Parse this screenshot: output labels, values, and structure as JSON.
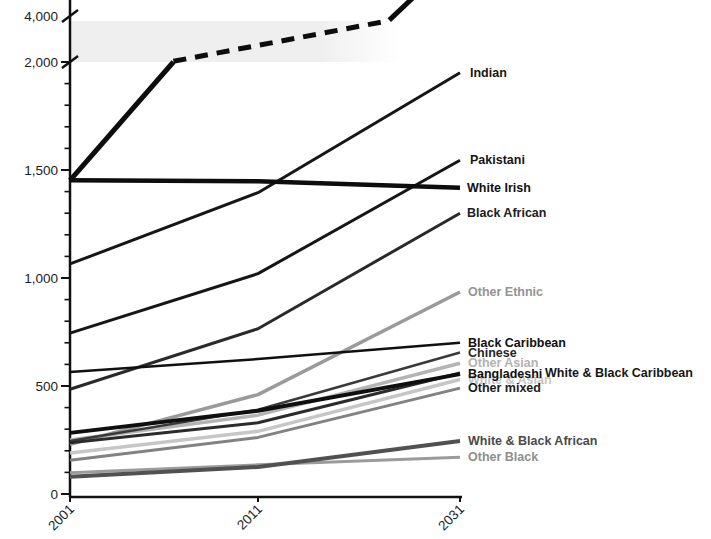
{
  "chart_data": {
    "type": "line",
    "title": "",
    "unit": "thousands",
    "x": [
      2001,
      2011,
      2031
    ],
    "x_tick_labels": [
      "2001",
      "2011",
      "2031"
    ],
    "y_ticks": [
      {
        "value": 0,
        "label": "0"
      },
      {
        "value": 500,
        "label": "500"
      },
      {
        "value": 1000,
        "label": "1,000"
      },
      {
        "value": 1500,
        "label": "1,500"
      },
      {
        "value": 2000,
        "label": "2,000"
      },
      {
        "value": 4000,
        "label": "4,000"
      }
    ],
    "y_minor_tick_step": 100,
    "axis_break": {
      "between": [
        2000,
        4000
      ],
      "band_color": "#efefef"
    },
    "grid": false,
    "legend_position": "right-edge-labels",
    "series": [
      {
        "id": "white-asian",
        "label": "White & Asian",
        "color": "#c6c6c6",
        "label_color": "#c4c4c4",
        "width": 3.5,
        "values": [
          190,
          290,
          530
        ]
      },
      {
        "id": "other-asian",
        "label": "Other Asian",
        "color": "#b4b4b4",
        "label_color": "#b2b2b2",
        "width": 3.5,
        "values": [
          250,
          365,
          605
        ]
      },
      {
        "id": "other-black",
        "label": "Other Black",
        "color": "#9b9b9b",
        "label_color": "#8e8e8e",
        "width": 3,
        "values": [
          98,
          135,
          170
        ]
      },
      {
        "id": "other-ethnic",
        "label": "Other Ethnic",
        "color": "#9a9a9a",
        "label_color": "#949494",
        "width": 3.5,
        "values": [
          230,
          460,
          935
        ]
      },
      {
        "id": "other-mixed",
        "label": "Other mixed",
        "color": "#828282",
        "label_color": "#1a1a1a",
        "width": 3,
        "values": [
          156,
          262,
          490
        ]
      },
      {
        "id": "white-black-african",
        "label": "White & Black African",
        "color": "#515151",
        "label_color": "#4a4a4a",
        "width": 4,
        "values": [
          80,
          125,
          245
        ]
      },
      {
        "id": "chinese",
        "label": "Chinese",
        "color": "#3a3a3a",
        "label_color": "#262626",
        "width": 2.5,
        "values": [
          245,
          390,
          655
        ]
      },
      {
        "id": "white-black-caribbean",
        "label": "White & Black Caribbean",
        "color": "#2b2b2b",
        "label_color": "#161616",
        "width": 3,
        "values": [
          237,
          330,
          560
        ],
        "label_x": 545
      },
      {
        "id": "black-african",
        "label": "Black African",
        "color": "#2a2a2a",
        "label_color": "#202020",
        "width": 3,
        "values": [
          485,
          765,
          1300
        ],
        "label_x": 467
      },
      {
        "id": "black-caribbean",
        "label": "Black Caribbean",
        "color": "#101010",
        "label_color": "#101010",
        "width": 2.5,
        "values": [
          565,
          625,
          700
        ]
      },
      {
        "id": "bangladeshi",
        "label": "Bangladeshi",
        "color": "#0f0f0f",
        "label_color": "#101010",
        "width": 4,
        "values": [
          283,
          385,
          555
        ]
      },
      {
        "id": "pakistani",
        "label": "Pakistani",
        "color": "#161616",
        "label_color": "#161616",
        "width": 3,
        "values": [
          745,
          1020,
          1545
        ],
        "label_x": 470
      },
      {
        "id": "indian",
        "label": "Indian",
        "color": "#161616",
        "label_color": "#161616",
        "width": 3,
        "values": [
          1065,
          1395,
          1950
        ],
        "label_x": 470
      },
      {
        "id": "white-irish",
        "label": "White Irish",
        "color": "#0d0d0d",
        "label_color": "#101010",
        "width": 4.5,
        "values": [
          1452,
          1448,
          1418
        ],
        "label_x": 467
      }
    ],
    "offscale_series": {
      "id": "offscale-top-line",
      "label": "",
      "color": "#0d0d0d",
      "width": 5,
      "segments": [
        {
          "style": "solid",
          "points": [
            [
              2001,
              1452
            ],
            [
              2006.5,
              2000
            ]
          ]
        },
        {
          "style": "dashed",
          "points": [
            [
              2006.5,
              2030
            ],
            [
              2024,
              3800
            ]
          ]
        },
        {
          "style": "solid",
          "points": [
            [
              2024,
              3820
            ],
            [
              2026.6,
              4900
            ]
          ]
        }
      ]
    },
    "axis_color": "#111111"
  }
}
